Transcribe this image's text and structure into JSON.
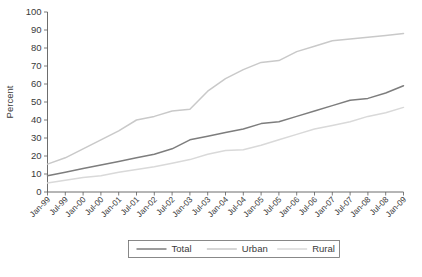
{
  "chart_data": {
    "type": "line",
    "title": "",
    "xlabel": "",
    "ylabel": "Percent",
    "ylim": [
      0,
      100
    ],
    "ytick_step": 10,
    "grid": false,
    "legend_position": "bottom",
    "categories": [
      "Jan-99",
      "Jul-99",
      "Jan-00",
      "Jul-00",
      "Jan-01",
      "Jul-01",
      "Jan-02",
      "Jul-02",
      "Jan-03",
      "Jul-03",
      "Jan-04",
      "Jul-04",
      "Jan-05",
      "Jul-05",
      "Jan-06",
      "Jul-06",
      "Jan-07",
      "Jul-07",
      "Jan-08",
      "Jul-08",
      "Jan-09"
    ],
    "yticks": [
      0,
      10,
      20,
      30,
      40,
      50,
      60,
      70,
      80,
      90,
      100
    ],
    "series": [
      {
        "name": "Total",
        "color": "#7d7d7d",
        "width": 1.5,
        "values": [
          9,
          11,
          13,
          15,
          17,
          19,
          21,
          24,
          29,
          31,
          33,
          35,
          38,
          39,
          42,
          45,
          48,
          51,
          52,
          55,
          59
        ]
      },
      {
        "name": "Urban",
        "color": "#c9c9c9",
        "width": 1.5,
        "values": [
          15.5,
          19,
          24,
          29,
          34,
          40,
          42,
          45,
          46,
          56,
          63,
          68,
          72,
          73,
          78,
          81,
          84,
          85,
          86,
          87,
          88
        ]
      },
      {
        "name": "Rural",
        "color": "#d9d9d9",
        "width": 1.5,
        "values": [
          5,
          6.5,
          8,
          9,
          11,
          12.5,
          14,
          16,
          18,
          21,
          23,
          23.5,
          26,
          29,
          32,
          35,
          37,
          39,
          42,
          44,
          47
        ]
      }
    ]
  },
  "legend": {
    "items": [
      {
        "label": "Total",
        "color": "#7d7d7d"
      },
      {
        "label": "Urban",
        "color": "#c9c9c9"
      },
      {
        "label": "Rural",
        "color": "#d9d9d9"
      }
    ]
  },
  "axes": {
    "y_title": "Percent"
  }
}
